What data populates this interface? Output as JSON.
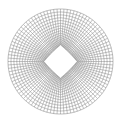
{
  "diagram": {
    "type": "structured-mesh",
    "width": 124,
    "height": 122,
    "background": "#ffffff",
    "line_color": "#8c8c8c",
    "line_width": 0.55,
    "center": [
      60.5,
      61.5
    ],
    "outer_boundary": {
      "shape": "circle",
      "radius": 52.5
    },
    "inner_boundary": {
      "shape": "diamond",
      "half_diagonal": 17,
      "corner_rounding": 0.12
    },
    "radial_lines": 96,
    "rings": 16,
    "ring_clustering": 1.35
  }
}
